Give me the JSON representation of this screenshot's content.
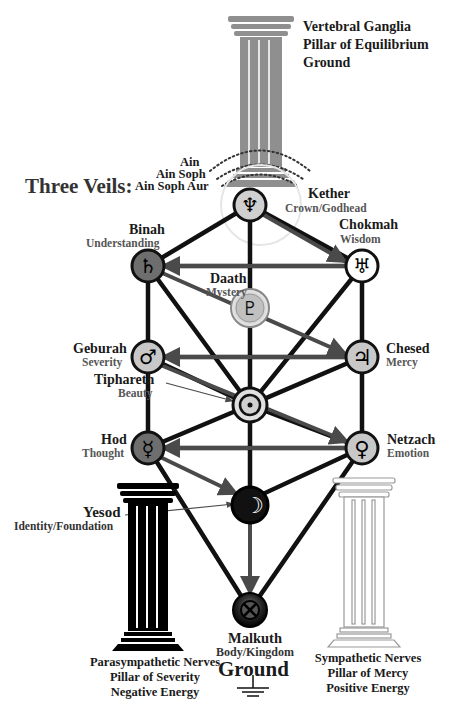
{
  "top_pillar": {
    "lines": [
      "Vertebral Ganglia",
      "Pillar of Equilibrium",
      "Ground"
    ],
    "color": "#8f8f8f"
  },
  "veils": {
    "label": "Three Veils:",
    "items": [
      "Ain",
      "Ain Soph",
      "Ain Soph Aur"
    ]
  },
  "sephiroth": [
    {
      "name": "Kether",
      "meaning": "Crown/Godhead",
      "symbol": "Neptune",
      "glyph": "♆",
      "fill": "#d0d0d0"
    },
    {
      "name": "Chokmah",
      "meaning": "Wisdom",
      "symbol": "Uranus",
      "glyph": "♅",
      "fill": "#ffffff"
    },
    {
      "name": "Binah",
      "meaning": "Understanding",
      "symbol": "Saturn",
      "glyph": "♄",
      "fill": "#6e6e6e"
    },
    {
      "name": "Daath",
      "meaning": "Mystery",
      "symbol": "Pluto",
      "glyph": "♇",
      "fill": "#b8b8b8"
    },
    {
      "name": "Chesed",
      "meaning": "Mercy",
      "symbol": "Jupiter",
      "glyph": "♃",
      "fill": "#c8c8c8"
    },
    {
      "name": "Geburah",
      "meaning": "Severity",
      "symbol": "Mars",
      "glyph": "♂",
      "fill": "#c8c8c8"
    },
    {
      "name": "Tiphareth",
      "meaning": "Beauty",
      "symbol": "Sun",
      "glyph": "◎",
      "fill": "#d8d8d8"
    },
    {
      "name": "Netzach",
      "meaning": "Emotion",
      "symbol": "Venus",
      "glyph": "♀",
      "fill": "#c8c8c8"
    },
    {
      "name": "Hod",
      "meaning": "Thought",
      "symbol": "Mercury",
      "glyph": "☿",
      "fill": "#6e6e6e"
    },
    {
      "name": "Yesod",
      "meaning": "Identity/Foundation",
      "symbol": "Moon",
      "glyph": "☽",
      "fill": "#111111"
    },
    {
      "name": "Malkuth",
      "meaning": "Body/Kingdom",
      "symbol": "Earth",
      "glyph": "⊗",
      "fill": "#222222"
    }
  ],
  "ground": {
    "label": "Ground"
  },
  "left_pillar": {
    "lines": [
      "Parasympathetic Nerves",
      "Pillar of Severity",
      "Negative Energy"
    ],
    "color": "#000000"
  },
  "right_pillar": {
    "lines": [
      "Sympathetic Nerves",
      "Pillar of Mercy",
      "Positive Energy"
    ],
    "color": "#ffffff"
  }
}
